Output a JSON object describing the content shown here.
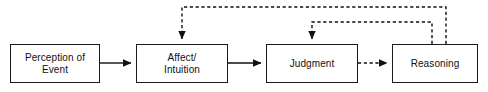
{
  "diagram": {
    "type": "flowchart",
    "canvas": {
      "width": 488,
      "height": 92,
      "background": "#ffffff"
    },
    "style": {
      "box_border_color": "#1a1a1a",
      "box_fill": "#ffffff",
      "line_color": "#111111",
      "text_color": "#111111"
    },
    "nodes": [
      {
        "id": "perception",
        "label": "Perception of\nEvent",
        "x": 10,
        "y": 44,
        "width": 90,
        "height": 39
      },
      {
        "id": "affect",
        "label": "Affect/\nIntuition",
        "x": 136,
        "y": 44,
        "width": 92,
        "height": 39
      },
      {
        "id": "judgment",
        "label": "Judgment",
        "x": 266,
        "y": 44,
        "width": 92,
        "height": 39
      },
      {
        "id": "reasoning",
        "label": "Reasoning",
        "x": 392,
        "y": 44,
        "width": 86,
        "height": 39
      }
    ],
    "edges": [
      {
        "id": "perception-to-affect",
        "from": "perception",
        "to": "affect",
        "style": "solid",
        "arrow": "filled",
        "path": "M 100 63 L 132 63"
      },
      {
        "id": "affect-to-judgment",
        "from": "affect",
        "to": "judgment",
        "style": "solid",
        "arrow": "filled",
        "path": "M 228 63 L 262 63"
      },
      {
        "id": "judgment-to-reasoning",
        "from": "judgment",
        "to": "reasoning",
        "style": "dashed",
        "arrow": "filled",
        "path": "M 358 63 L 388 63"
      },
      {
        "id": "reasoning-to-affect-feedback",
        "from": "reasoning",
        "to": "affect",
        "style": "dashed",
        "arrow": "filled",
        "path": "M 446 44 L 446 7 L 182 7 L 182 40"
      },
      {
        "id": "reasoning-to-judgment-feedback",
        "from": "reasoning",
        "to": "judgment",
        "style": "dashed",
        "arrow": "filled",
        "path": "M 432 44 L 432 22 L 312 22 L 312 40"
      }
    ]
  }
}
